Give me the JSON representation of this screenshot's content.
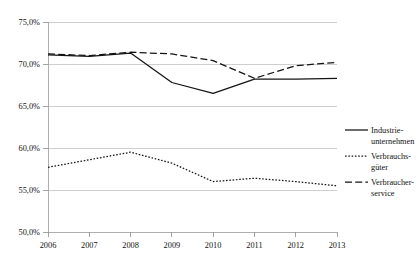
{
  "chart_data": {
    "type": "line",
    "title": "",
    "xlabel": "",
    "ylabel": "",
    "categories": [
      "2006",
      "2007",
      "2008",
      "2009",
      "2010",
      "2011",
      "2012",
      "2013"
    ],
    "x": [
      2006,
      2007,
      2008,
      2009,
      2010,
      2011,
      2012,
      2013
    ],
    "ylim": [
      50.0,
      75.0
    ],
    "xlim": [
      2006,
      2013
    ],
    "y_tick_values": [
      50.0,
      55.0,
      60.0,
      65.0,
      70.0,
      75.0
    ],
    "y_tick_labels": [
      "50,0%",
      "55,0%",
      "60,0%",
      "65,0%",
      "70,0%",
      "75,0%"
    ],
    "x_tick_labels": [
      "2006",
      "2007",
      "2008",
      "2009",
      "2010",
      "2011",
      "2012",
      "2013"
    ],
    "grid": "horizontal",
    "legend_position": "right",
    "value_suffix": "%",
    "decimal_separator": ",",
    "series": [
      {
        "name": "Industrie-unternehmen",
        "label_line1": "Industrie-",
        "label_line2": "unternehmen",
        "style": "solid",
        "color": "#141414",
        "values": [
          71.1,
          70.9,
          71.3,
          67.8,
          66.5,
          68.2,
          68.2,
          68.3
        ]
      },
      {
        "name": "Verbrauchs-güter",
        "label_line1": "Verbrauchs-",
        "label_line2": "güter",
        "style": "dotted",
        "color": "#141414",
        "values": [
          57.7,
          58.6,
          59.5,
          58.2,
          56.0,
          56.4,
          56.0,
          55.5
        ]
      },
      {
        "name": "Verbraucher-service",
        "label_line1": "Verbraucher-",
        "label_line2": "service",
        "style": "dashed",
        "color": "#141414",
        "values": [
          71.2,
          71.0,
          71.4,
          71.2,
          70.4,
          68.3,
          69.8,
          70.2
        ]
      }
    ]
  },
  "legend": {
    "items": [
      {
        "line1": "Industrie-",
        "line2": "unternehmen",
        "style": "solid"
      },
      {
        "line1": "Verbrauchs-",
        "line2": "güter",
        "style": "dotted"
      },
      {
        "line1": "Verbraucher-",
        "line2": "service",
        "style": "dashed"
      }
    ]
  },
  "axis": {
    "y_labels": [
      "75,0%",
      "70,0%",
      "65,0%",
      "60,0%",
      "55,0%",
      "50,0%"
    ],
    "x_labels": [
      "2006",
      "2007",
      "2008",
      "2009",
      "2010",
      "2011",
      "2012",
      "2013"
    ]
  }
}
